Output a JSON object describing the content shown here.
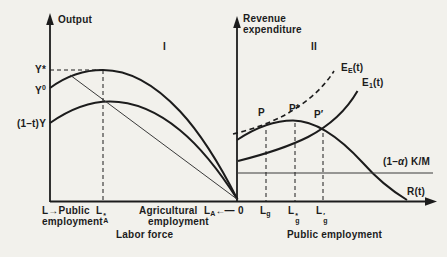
{
  "colors": {
    "ink": "#1c1c1c",
    "paper": "#f2f1ec"
  },
  "left_panel": {
    "panel_label": "I",
    "y_axis_label": "Output",
    "y_labels": {
      "ystar": "Y*",
      "y0_base": "Y",
      "y0_sup": "0",
      "y_after_tax": "(1–t)Y"
    },
    "x_labels": {
      "l_public": "L→Public",
      "employment_public": "employment",
      "la_star_base": "L",
      "la_star_sup": "*",
      "la_star_sub": "A",
      "agricultural": "Agricultural",
      "employment_agri": "employment",
      "la_base": "L",
      "la_sub": "A",
      "la_arrow": "←—",
      "zero": "0"
    },
    "caption": "Labor force"
  },
  "right_panel": {
    "panel_label": "II",
    "y_axis_label_line1": "Revenue",
    "y_axis_label_line2": "expenditure",
    "curve_labels": {
      "ee_base": "E",
      "ee_sub": "E",
      "ee_paren": "(t)",
      "e1_base": "E",
      "e1_sub": "1",
      "e1_paren": "(t)",
      "rt": "R(t)",
      "km_pre": "(1–",
      "km_alpha": "α",
      "km_post": ") K/M"
    },
    "point_labels": {
      "p": "P",
      "p_star": "P*",
      "p_prime": "P′"
    },
    "x_labels": {
      "lg_base": "L",
      "lg_sub": "g",
      "lg_star_base": "L",
      "lg_star_sup": "*",
      "lg_star_sub": "g",
      "lg_prime_base": "L",
      "lg_prime_sup": "′",
      "lg_prime_sub": "g"
    },
    "caption": "Public employment"
  }
}
